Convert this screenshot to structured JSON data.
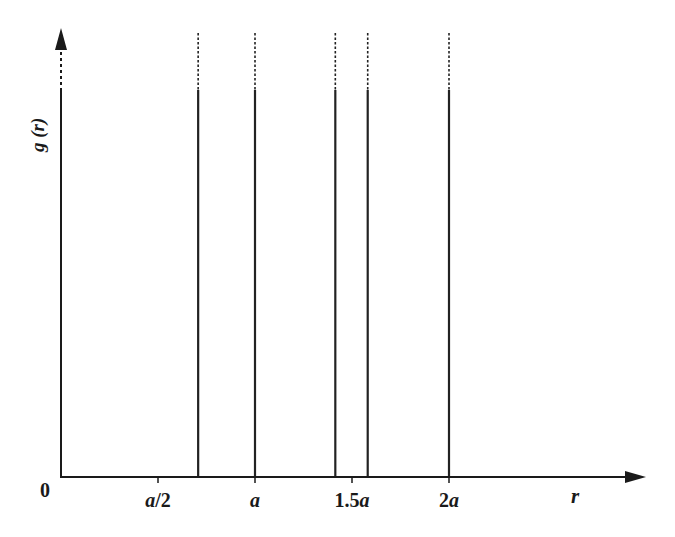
{
  "chart_data": {
    "type": "bar",
    "title": "",
    "xlabel": "r",
    "ylabel": "g (r)",
    "origin_label": "0",
    "x_ticks": [
      {
        "label": "a/2",
        "value": 0.5
      },
      {
        "label": "a",
        "value": 1.0
      },
      {
        "label": "1.5a",
        "value": 1.5
      },
      {
        "label": "2a",
        "value": 2.0
      }
    ],
    "x_unit": "a",
    "xlim": [
      0,
      2.5
    ],
    "grid": false,
    "legend": null,
    "annotations": "Delta-function peaks drawn as vertical lines; dashed tops indicate peaks extending to infinity",
    "peaks": [
      {
        "r": 0.0,
        "label": "0"
      },
      {
        "r": 0.707,
        "label": "a/√2"
      },
      {
        "r": 1.0,
        "label": "a"
      },
      {
        "r": 1.414,
        "label": "√2 a"
      },
      {
        "r": 1.581,
        "label": "√(5/2) a"
      },
      {
        "r": 2.0,
        "label": "2a"
      }
    ],
    "categories": [
      "0",
      "0.707a",
      "a",
      "1.414a",
      "1.581a",
      "2a"
    ],
    "values": [
      "inf",
      "inf",
      "inf",
      "inf",
      "inf",
      "inf"
    ]
  },
  "colors": {
    "axis": "#1a1a1a",
    "line": "#222222",
    "background": "#ffffff"
  }
}
